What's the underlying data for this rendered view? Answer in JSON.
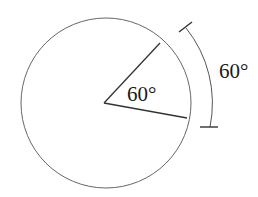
{
  "diagram": {
    "title": "",
    "colors": {
      "stroke": "#555555",
      "text": "#1a1a1a",
      "background": "#ffffff"
    },
    "circle": {
      "cx": 106,
      "cy": 103,
      "r": 85
    },
    "central_angle": {
      "label": "60°",
      "radius_upper_end": [
        160,
        43
      ],
      "radius_lower_end": [
        187,
        117
      ]
    },
    "arc_dimension": {
      "label": "60°",
      "arc_start": [
        186,
        28
      ],
      "arc_end": [
        209,
        127
      ]
    }
  }
}
